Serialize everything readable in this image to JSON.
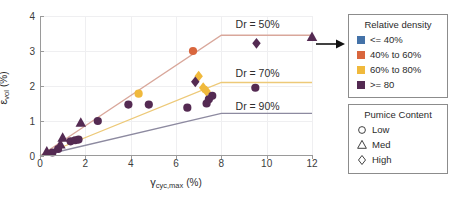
{
  "chart_data": {
    "type": "scatter",
    "title": "",
    "xlabel": "γ_cyc,max (%)",
    "ylabel": "ε_vol (%)",
    "xlim": [
      0,
      12
    ],
    "ylim": [
      0,
      4
    ],
    "xticks": [
      0,
      2,
      4,
      6,
      8,
      10,
      12
    ],
    "yticks": [
      0,
      1,
      2,
      3,
      4
    ],
    "grid": true,
    "legend_position": "right-outside",
    "annotations": [
      {
        "text": "Dr = 50%",
        "x": 9.6,
        "y": 3.78
      },
      {
        "text": "Dr = 70%",
        "x": 9.6,
        "y": 2.38
      },
      {
        "text": "Dr = 90%",
        "x": 9.6,
        "y": 1.43
      }
    ],
    "arrow_annotation": {
      "from_x": 12.0,
      "from_y": 3.4,
      "direction": "right"
    },
    "series": [
      {
        "name": "Dr = 50%",
        "type": "line",
        "color": "#d9a79b",
        "x": [
          0,
          8,
          12
        ],
        "values": [
          0,
          3.45,
          3.45
        ]
      },
      {
        "name": "Dr = 70%",
        "type": "line",
        "color": "#edc978",
        "x": [
          0,
          8,
          12
        ],
        "values": [
          0,
          2.1,
          2.1
        ]
      },
      {
        "name": "Dr = 90%",
        "type": "line",
        "color": "#8d8aa0",
        "x": [
          0,
          8,
          12
        ],
        "values": [
          0,
          1.22,
          1.22
        ]
      },
      {
        "name": "40% to 60% / Low",
        "type": "scatter",
        "marker": "circle",
        "color": "#d9663d",
        "points": [
          [
            6.75,
            3.0
          ]
        ]
      },
      {
        "name": "60% to 80% / Low",
        "type": "scatter",
        "marker": "circle",
        "color": "#f0b93c",
        "points": [
          [
            4.35,
            1.78
          ]
        ]
      },
      {
        "name": "60% to 80% / High",
        "type": "scatter",
        "marker": "diamond",
        "color": "#f0b93c",
        "points": [
          [
            7.0,
            2.28
          ],
          [
            7.2,
            1.95
          ],
          [
            7.35,
            1.85
          ]
        ]
      },
      {
        "name": ">= 80 / Low",
        "type": "scatter",
        "marker": "circle",
        "color": "#542a52",
        "points": [
          [
            0.55,
            0.1
          ],
          [
            0.8,
            0.2
          ],
          [
            1.35,
            0.42
          ],
          [
            1.55,
            0.45
          ],
          [
            1.7,
            0.47
          ],
          [
            2.55,
            1.0
          ],
          [
            3.9,
            1.47
          ],
          [
            4.8,
            1.47
          ],
          [
            6.5,
            1.38
          ],
          [
            7.45,
            1.62
          ],
          [
            7.6,
            1.72
          ],
          [
            9.5,
            1.95
          ],
          [
            7.35,
            1.5
          ]
        ]
      },
      {
        "name": ">= 80 / Med",
        "type": "scatter",
        "marker": "triangle",
        "color": "#542a52",
        "points": [
          [
            0.3,
            0.13
          ],
          [
            0.9,
            0.33
          ],
          [
            1.0,
            0.52
          ],
          [
            1.8,
            0.95
          ],
          [
            12.0,
            3.4
          ]
        ]
      },
      {
        "name": ">= 80 / High",
        "type": "scatter",
        "marker": "diamond",
        "color": "#542a52",
        "points": [
          [
            6.85,
            2.12
          ],
          [
            9.55,
            3.22
          ]
        ]
      }
    ]
  },
  "axes": {
    "xlabel_symbol": "γ",
    "xlabel_sub": "cyc,max",
    "xlabel_unit": "(%)",
    "ylabel_symbol": "ε",
    "ylabel_sub": "vol",
    "ylabel_unit": "(%)",
    "xticklabels": [
      "0",
      "2",
      "4",
      "6",
      "8",
      "10",
      "12"
    ],
    "yticklabels": [
      "0",
      "1",
      "2",
      "3",
      "4"
    ]
  },
  "legend_density": {
    "title": "Relative density",
    "items": [
      {
        "label": "<= 40%",
        "color": "#4472a8"
      },
      {
        "label": "40% to 60%",
        "color": "#d9663d"
      },
      {
        "label": "60% to 80%",
        "color": "#f0b93c"
      },
      {
        "label": ">= 80",
        "color": "#542a52"
      }
    ]
  },
  "legend_pumice": {
    "title": "Pumice Content",
    "items": [
      {
        "label": "Low",
        "marker": "circle"
      },
      {
        "label": "Med",
        "marker": "triangle"
      },
      {
        "label": "High",
        "marker": "diamond"
      }
    ]
  }
}
